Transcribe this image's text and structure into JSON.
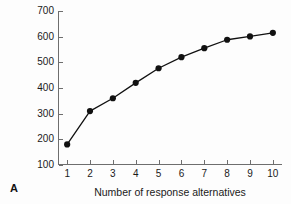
{
  "figure": {
    "panel_label": "A",
    "line_color": "#111111",
    "marker_color": "#111111",
    "axis_color": "#6e6e6e",
    "background": "#fdfdfd"
  },
  "chart_data": {
    "type": "line",
    "title": "",
    "xlabel": "Number of response alternatives",
    "ylabel": "Choice reaction time (msec)",
    "x": [
      1,
      2,
      3,
      4,
      5,
      6,
      7,
      8,
      9,
      10
    ],
    "values": [
      180,
      310,
      360,
      420,
      477,
      520,
      555,
      588,
      601,
      615
    ],
    "series": [
      {
        "name": "Choice reaction time",
        "values": [
          180,
          310,
          360,
          420,
          477,
          520,
          555,
          588,
          601,
          615
        ]
      }
    ],
    "xlim": [
      0.6,
      10.4
    ],
    "ylim": [
      100,
      700
    ],
    "xticks": [
      1,
      2,
      3,
      4,
      5,
      6,
      7,
      8,
      9,
      10
    ],
    "xtick_labels": [
      "1",
      "2",
      "3",
      "4",
      "5",
      "6",
      "7",
      "8",
      "9",
      "10"
    ],
    "yticks": [
      100,
      200,
      300,
      400,
      500,
      600,
      700
    ],
    "ytick_labels": [
      "100",
      "200",
      "300",
      "400",
      "500",
      "600",
      "700"
    ],
    "grid": false,
    "legend": false,
    "marker": "filled-circle"
  }
}
